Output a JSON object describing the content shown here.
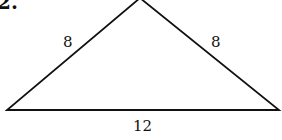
{
  "problem": {
    "number": "2."
  },
  "triangle": {
    "type": "isosceles",
    "sides": {
      "left": "8",
      "right": "8",
      "base": "12"
    },
    "vertices": {
      "apex": [
        140,
        -2
      ],
      "left": [
        7,
        110
      ],
      "right": [
        279,
        110
      ]
    },
    "stroke_color": "#111111"
  }
}
